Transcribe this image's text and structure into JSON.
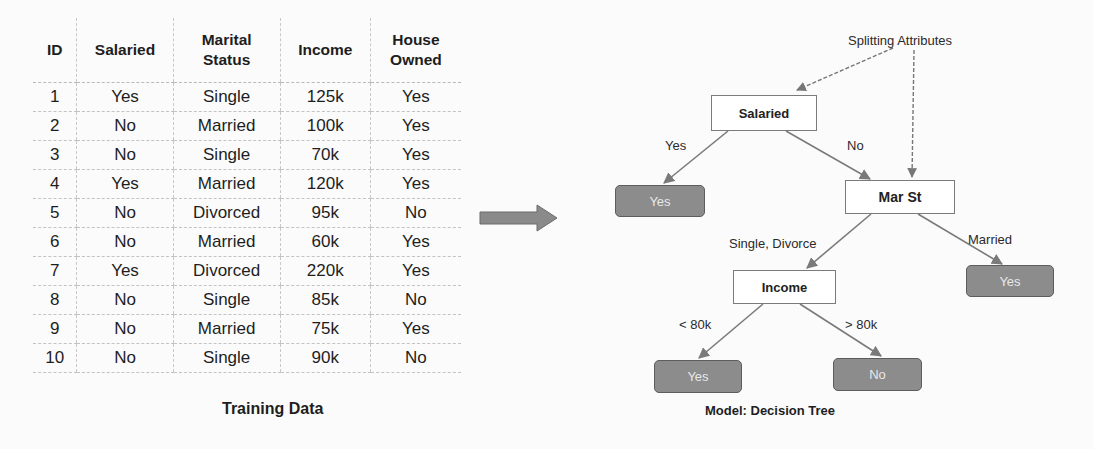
{
  "training_table": {
    "columns": [
      {
        "label": "ID"
      },
      {
        "label": "Salaried"
      },
      {
        "label_line1": "Marital",
        "label_line2": "Status"
      },
      {
        "label": "Income"
      },
      {
        "label_line1": "House",
        "label_line2": "Owned"
      }
    ],
    "rows": [
      {
        "id": "1",
        "salaried": "Yes",
        "marital": "Single",
        "income": "125k",
        "owned": "Yes"
      },
      {
        "id": "2",
        "salaried": "No",
        "marital": "Married",
        "income": "100k",
        "owned": "Yes"
      },
      {
        "id": "3",
        "salaried": "No",
        "marital": "Single",
        "income": "70k",
        "owned": "Yes"
      },
      {
        "id": "4",
        "salaried": "Yes",
        "marital": "Married",
        "income": "120k",
        "owned": "Yes"
      },
      {
        "id": "5",
        "salaried": "No",
        "marital": "Divorced",
        "income": "95k",
        "owned": "No"
      },
      {
        "id": "6",
        "salaried": "No",
        "marital": "Married",
        "income": "60k",
        "owned": "Yes"
      },
      {
        "id": "7",
        "salaried": "Yes",
        "marital": "Divorced",
        "income": "220k",
        "owned": "Yes"
      },
      {
        "id": "8",
        "salaried": "No",
        "marital": "Single",
        "income": "85k",
        "owned": "No"
      },
      {
        "id": "9",
        "salaried": "No",
        "marital": "Married",
        "income": "75k",
        "owned": "Yes"
      },
      {
        "id": "10",
        "salaried": "No",
        "marital": "Single",
        "income": "90k",
        "owned": "No"
      }
    ],
    "caption": "Training Data"
  },
  "arrow": {
    "icon": "right-arrow-icon",
    "color": "#8a8a8a"
  },
  "decision_tree": {
    "annotation": "Splitting Attributes",
    "nodes": {
      "root": {
        "label": "Salaried"
      },
      "root_yes_leaf": {
        "label": "Yes"
      },
      "marital": {
        "label": "Mar St"
      },
      "marital_married_leaf": {
        "label": "Yes"
      },
      "income": {
        "label": "Income"
      },
      "income_low_leaf": {
        "label": "Yes"
      },
      "income_high_leaf": {
        "label": "No"
      }
    },
    "edges": {
      "root_yes": "Yes",
      "root_no": "No",
      "marital_single_divorce": "Single, Divorce",
      "marital_married": "Married",
      "income_low": "< 80k",
      "income_high": "> 80k"
    },
    "caption": "Model: Decision Tree",
    "colors": {
      "leaf_fill": "#8c8c8c",
      "leaf_border": "#5d5d5d",
      "split_border": "#7b7b7b",
      "edge": "#7a7a7a"
    }
  }
}
